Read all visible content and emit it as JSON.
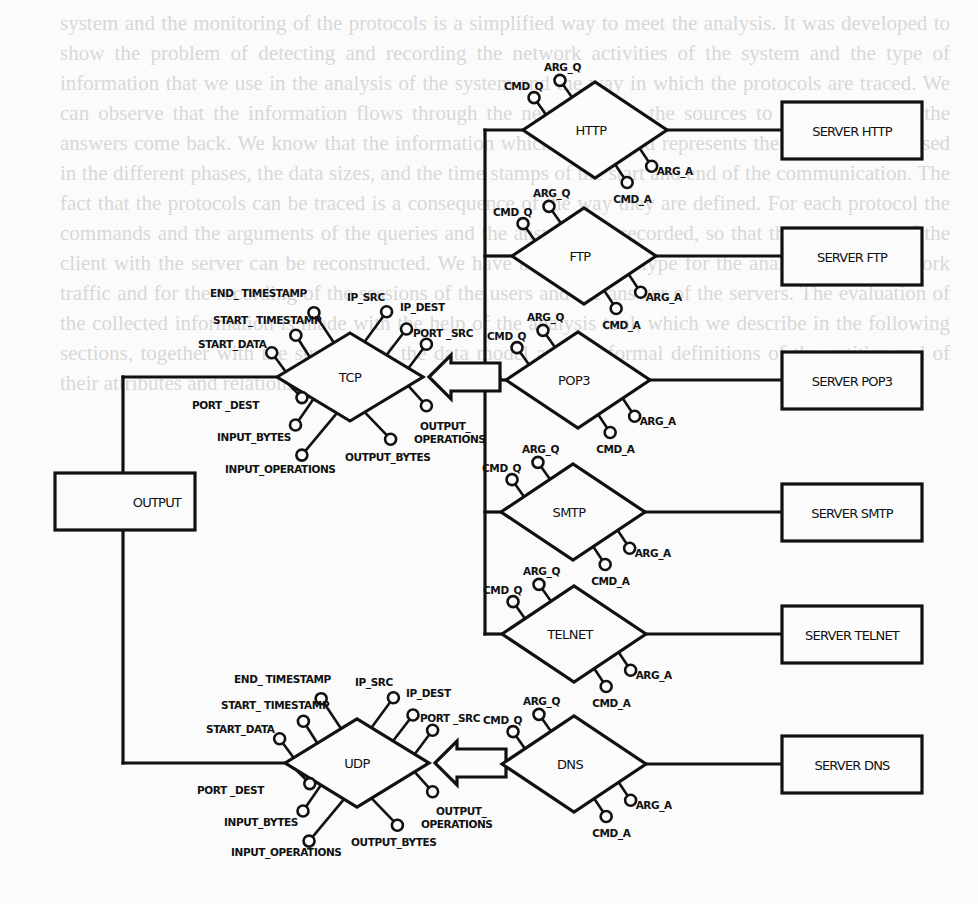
{
  "background_text": "system and the monitoring of the protocols is a simplified way to meet the analysis. It was developed to show the problem of detecting and recording the network activities of the system and the type of information that we use in the analysis of the system and the way in which the protocols are traced. We can observe that the information flows through the network from the sources to the servers and the answers come back. We know that the information which is collected represents the data to be analysed in the different phases, the data sizes, and the time stamps of the start and end of the communication. The fact that the protocols can be traced is a consequence of the way they are defined. For each protocol the commands and the arguments of the queries and the answers are recorded, so that the connection of the client with the server can be reconstructed. We have built the prototype for the analysis of the network traffic and for the recording of the sessions of the users and the answer of the servers. The evaluation of the collected information is made with the help of the analysis tool, which we describe in the following sections, together with the structure of the data model and the formal definitions of the entities and of their attributes and relations.",
  "diagram": {
    "output_box": {
      "label": "OUTPUT",
      "x": 55,
      "y": 473,
      "w": 140,
      "h": 57
    },
    "transport_nodes": [
      {
        "id": "tcp",
        "label": "TCP",
        "cx": 350,
        "cy": 377,
        "hw": 73,
        "hh": 44,
        "attributes": [
          {
            "label": "END_ TIMESTAMP",
            "lx": 210,
            "ly": 297
          },
          {
            "label": "START_ TIMESTAMP",
            "lx": 213,
            "ly": 324
          },
          {
            "label": "START_DATA",
            "lx": 198,
            "ly": 348
          },
          {
            "label": "IP_SRC",
            "lx": 347,
            "ly": 301
          },
          {
            "label": "IP_DEST",
            "lx": 400,
            "ly": 311
          },
          {
            "label": "PORT _SRC",
            "lx": 413,
            "ly": 337
          },
          {
            "label": "PORT _DEST",
            "lx": 192,
            "ly": 409
          },
          {
            "label": "INPUT_BYTES",
            "lx": 217,
            "ly": 441
          },
          {
            "label": "INPUT_OPERATIONS",
            "lx": 225,
            "ly": 473
          },
          {
            "label": "OUTPUT_BYTES",
            "lx": 345,
            "ly": 461
          },
          {
            "label": "OUTPUT_",
            "lx": 420,
            "ly": 430
          },
          {
            "label": "OPERATIONS",
            "lx": 414,
            "ly": 443
          }
        ]
      },
      {
        "id": "udp",
        "label": "UDP",
        "cx": 357,
        "cy": 763,
        "hw": 72,
        "hh": 44,
        "attributes": [
          {
            "label": "END_ TIMESTAMP",
            "lx": 234,
            "ly": 683
          },
          {
            "label": "START_ TIMESTAMP",
            "lx": 221,
            "ly": 709
          },
          {
            "label": "START_DATA",
            "lx": 206,
            "ly": 733
          },
          {
            "label": "IP_SRC",
            "lx": 355,
            "ly": 686
          },
          {
            "label": "IP_DEST",
            "lx": 406,
            "ly": 697
          },
          {
            "label": "PORT _SRC",
            "lx": 420,
            "ly": 722
          },
          {
            "label": "PORT _DEST",
            "lx": 197,
            "ly": 794
          },
          {
            "label": "INPUT_BYTES",
            "lx": 224,
            "ly": 826
          },
          {
            "label": "INPUT_OPERATIONS",
            "lx": 231,
            "ly": 856
          },
          {
            "label": "OUTPUT_BYTES",
            "lx": 351,
            "ly": 846
          },
          {
            "label": "OUTPUT_",
            "lx": 436,
            "ly": 815
          },
          {
            "label": "OPERATIONS",
            "lx": 421,
            "ly": 828
          }
        ]
      }
    ],
    "bus_x": 485,
    "protocols": [
      {
        "id": "http",
        "label": "HTTP",
        "cx": 595,
        "cy": 130,
        "server": "SERVER HTTP",
        "sy": 102
      },
      {
        "id": "ftp",
        "label": "FTP",
        "cx": 584,
        "cy": 256,
        "server": "SERVER FTP",
        "sy": 228
      },
      {
        "id": "pop3",
        "label": "POP3",
        "cx": 578,
        "cy": 380,
        "server": "SERVER POP3",
        "sy": 352
      },
      {
        "id": "smtp",
        "label": "SMTP",
        "cx": 573,
        "cy": 512,
        "server": "SERVER SMTP",
        "sy": 484
      },
      {
        "id": "telnet",
        "label": "TELNET",
        "cx": 574,
        "cy": 634,
        "server": "SERVER TELNET",
        "sy": 606
      },
      {
        "id": "dns",
        "label": "DNS",
        "cx": 574,
        "cy": 764,
        "server": "SERVER DNS",
        "sy": 736
      }
    ],
    "protocol_attributes": [
      "CMD_Q",
      "ARG_Q",
      "ARG_A",
      "CMD_A"
    ],
    "server_box": {
      "x": 782,
      "w": 140,
      "h": 57
    },
    "colors": {
      "ink": "#111111",
      "paper": "#fbfbfb",
      "ghost_text": "#d8d8d8"
    }
  }
}
